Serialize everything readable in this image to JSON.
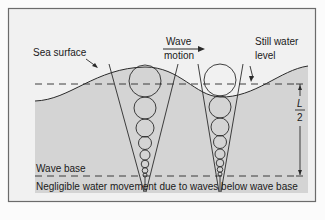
{
  "diagram": {
    "type": "wave-orbital-motion",
    "labels": {
      "sea_surface": "Sea surface",
      "wave_motion_line1": "Wave",
      "wave_motion_line2": "motion",
      "still_water_line1": "Still water",
      "still_water_line2": "level",
      "wave_base": "Wave base",
      "fraction_numerator": "L",
      "fraction_denominator": "2",
      "caption": "Negligible water movement due to waves below wave base"
    },
    "colors": {
      "background": "#fbfbfb",
      "frame_fill": "#f1f1f1",
      "frame_border": "#6b6b6b",
      "water": "#d4d4d4",
      "line": "#2a2a2a"
    },
    "orbit_columns": [
      {
        "name": "crest-column",
        "cx": 145,
        "circles": [
          {
            "cy": 82,
            "r": 16
          },
          {
            "cy": 113,
            "r": 11
          },
          {
            "cy": 136,
            "r": 9
          },
          {
            "cy": 153,
            "r": 6.5
          },
          {
            "cy": 166,
            "r": 5
          },
          {
            "cy": 176,
            "r": 3.8
          },
          {
            "cy": 183.5,
            "r": 2.8
          },
          {
            "cy": 188.5,
            "r": 2
          }
        ]
      },
      {
        "name": "trough-column",
        "cx": 220,
        "circles": [
          {
            "cy": 80,
            "r": 16
          },
          {
            "cy": 111,
            "r": 11
          },
          {
            "cy": 134,
            "r": 9
          },
          {
            "cy": 151,
            "r": 6.5
          },
          {
            "cy": 164,
            "r": 5
          },
          {
            "cy": 174.5,
            "r": 3.8
          },
          {
            "cy": 182,
            "r": 2.8
          },
          {
            "cy": 187.5,
            "r": 2
          }
        ]
      }
    ]
  }
}
